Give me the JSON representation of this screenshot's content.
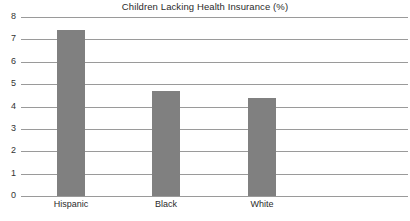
{
  "chart_data": {
    "type": "bar",
    "title": "Children Lacking Health Insurance (%)",
    "xlabel": "",
    "ylabel": "",
    "categories": [
      "Hispanic",
      "Black",
      "White"
    ],
    "values": [
      7.4,
      4.7,
      4.4
    ],
    "ylim": [
      0,
      8
    ],
    "yticks": [
      "0",
      "1",
      "2",
      "3",
      "4",
      "5",
      "6",
      "7",
      "8"
    ],
    "grid": true,
    "legend": "none",
    "bar_color": "#808080",
    "gridline_color": "#9a9a9a",
    "background_color": "#ffffff",
    "text_color": "#2b2b2b"
  }
}
